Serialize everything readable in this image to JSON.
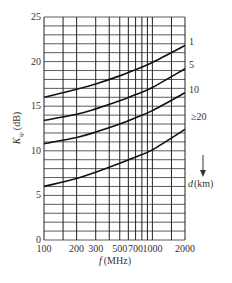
{
  "chart_data": {
    "type": "line",
    "title": "",
    "xlabel": "f (MHz)",
    "ylabel": "K_sp (dB)",
    "xscale": "log",
    "xlim": [
      100,
      2000
    ],
    "ylim": [
      0,
      25
    ],
    "grid": true,
    "x_tick_labels": [
      "100",
      "200",
      "300",
      "500",
      "700",
      "1000",
      "2000"
    ],
    "x_tick_values": [
      100,
      200,
      300,
      500,
      700,
      1000,
      2000
    ],
    "x_grid_values": [
      100,
      150,
      200,
      300,
      400,
      500,
      600,
      700,
      800,
      900,
      1000,
      1500,
      2000
    ],
    "y_tick_labels": [
      "0",
      "5",
      "10",
      "15",
      "20",
      "25"
    ],
    "y_tick_values": [
      0,
      5,
      10,
      15,
      20,
      25
    ],
    "y_grid_step": 1,
    "legend_title": "d (km)",
    "legend_position": "right",
    "legend_arrow": "down",
    "x": [
      100,
      200,
      300,
      500,
      700,
      1000,
      2000
    ],
    "series": [
      {
        "name": "1",
        "label": "1",
        "values": [
          16.0,
          16.9,
          17.5,
          18.4,
          19.1,
          19.9,
          21.8
        ]
      },
      {
        "name": "5",
        "label": "5",
        "values": [
          13.4,
          14.1,
          14.7,
          15.6,
          16.3,
          17.1,
          19.2
        ]
      },
      {
        "name": "10",
        "label": "10",
        "values": [
          10.8,
          11.5,
          12.1,
          13.0,
          13.7,
          14.5,
          16.5
        ]
      },
      {
        "name": ">=20",
        "label": "≥20",
        "values": [
          6.0,
          6.9,
          7.6,
          8.6,
          9.3,
          10.1,
          12.4
        ]
      }
    ]
  },
  "labels": {
    "ylabel_main": "K",
    "ylabel_sub": "sp",
    "ylabel_unit": "(dB)",
    "xlabel_var": "f",
    "xlabel_unit": "(MHz)",
    "legend_var": "d",
    "legend_unit": "(km)"
  }
}
